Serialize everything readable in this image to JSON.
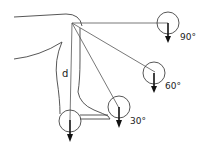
{
  "diagram": {
    "type": "biomechanics-leg-angles",
    "labels": {
      "distance": "d",
      "angle_90": "90°",
      "angle_60": "60°",
      "angle_30": "30°"
    },
    "positions": [
      {
        "name": "90-degree",
        "label": "90°"
      },
      {
        "name": "60-degree",
        "label": "60°"
      },
      {
        "name": "30-degree",
        "label": "30°"
      },
      {
        "name": "hanging-vertical",
        "label": ""
      }
    ],
    "colors": {
      "stroke": "#333333",
      "arrow": "#111111",
      "background": "#ffffff"
    }
  }
}
